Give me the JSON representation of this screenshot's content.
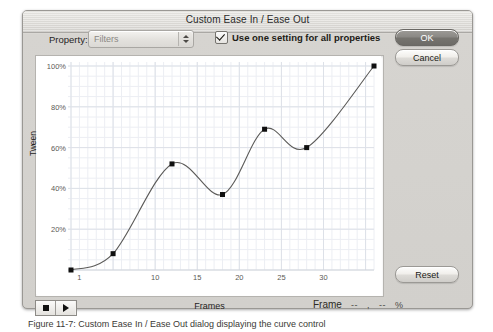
{
  "dialog": {
    "title": "Custom Ease In / Ease Out",
    "property_label": "Property:",
    "property_value": "Filters",
    "checkbox_label": "Use one setting for all properties",
    "checkbox_checked": true,
    "ok_label": "OK",
    "cancel_label": "Cancel",
    "reset_label": "Reset"
  },
  "transport": {
    "stop_icon": "stop-square-icon",
    "play_icon": "play-triangle-icon"
  },
  "readout": {
    "frame_label": "Frame",
    "frame_value": "--",
    "comma": ",",
    "percent_value": "--",
    "percent_sign": "%"
  },
  "caption": {
    "text": "Figure 11-7:  Custom Ease In / Ease Out dialog displaying the curve control"
  },
  "colors": {
    "curve": "#5b5a58",
    "point": "#101010",
    "grid_minor": "#eceef3",
    "grid_major": "#dde1e8",
    "plot_bg": "#ffffff",
    "dialog_bg": "#d6d4d0"
  },
  "chart_data": {
    "type": "line",
    "title": "",
    "xlabel": "Frames",
    "ylabel": "Tween",
    "xlim": [
      0,
      36
    ],
    "ylim": [
      0,
      100
    ],
    "xticks": [
      1,
      10,
      15,
      20,
      25,
      30
    ],
    "xtick_labels": [
      "1",
      "10",
      "15",
      "20",
      "25",
      "30"
    ],
    "yticks": [
      20,
      40,
      60,
      80,
      100
    ],
    "ytick_labels": [
      "20%",
      "40%",
      "60%",
      "80%",
      "100%"
    ],
    "grid": true,
    "legend": "none",
    "series": [
      {
        "name": "ease-curve",
        "control_points": [
          {
            "frame": 0,
            "percent": 0
          },
          {
            "frame": 5,
            "percent": 8
          },
          {
            "frame": 12,
            "percent": 52
          },
          {
            "frame": 18,
            "percent": 37
          },
          {
            "frame": 23,
            "percent": 69
          },
          {
            "frame": 28,
            "percent": 60
          },
          {
            "frame": 36,
            "percent": 100
          }
        ]
      }
    ]
  }
}
